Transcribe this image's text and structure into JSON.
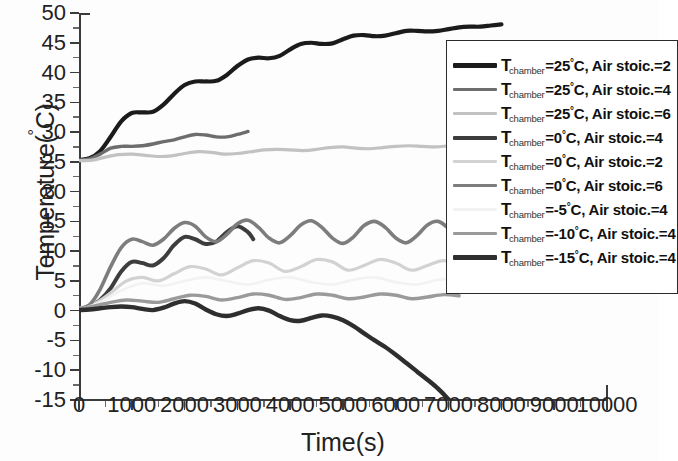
{
  "chart_data": {
    "type": "line",
    "title": "",
    "xlabel": "Time(s)",
    "ylabel": "Temperature(°C)",
    "xlim": [
      0,
      10000
    ],
    "ylim": [
      -15,
      50
    ],
    "xticks": [
      0,
      1000,
      2000,
      3000,
      4000,
      5000,
      6000,
      7000,
      8000,
      9000,
      10000
    ],
    "yticks": [
      -15,
      -10,
      -5,
      0,
      5,
      10,
      15,
      20,
      25,
      30,
      35,
      40,
      45,
      50
    ],
    "grid": false,
    "legend_position": "right-inside",
    "series": [
      {
        "name": "T_chamber=25°C, Air stoic.=2",
        "chamber_temp": 25,
        "air_stoic": 2,
        "color": "#1b1b1b",
        "width": 4.2,
        "x": [
          0,
          200,
          400,
          600,
          800,
          1000,
          1200,
          1400,
          1600,
          1800,
          2000,
          2200,
          2400,
          2600,
          2800,
          3000,
          3200,
          3400,
          3600,
          3800,
          4000,
          4200,
          4400,
          4600,
          4800,
          5000,
          5200,
          5400,
          5600,
          5800,
          6000,
          6200,
          6400,
          6600,
          6800,
          7000,
          7200,
          7400,
          7600,
          7800,
          8000
        ],
        "y": [
          25.3,
          25.6,
          26.8,
          29.2,
          31.8,
          33.2,
          33.3,
          33.4,
          34.6,
          36.4,
          37.9,
          38.5,
          38.5,
          38.6,
          39.6,
          41.1,
          42.2,
          42.5,
          42.4,
          42.8,
          43.9,
          44.8,
          45.0,
          44.8,
          44.9,
          45.6,
          46.2,
          46.3,
          46.1,
          46.2,
          46.6,
          47.0,
          47.0,
          46.9,
          47.0,
          47.3,
          47.6,
          47.7,
          47.7,
          47.9,
          48.1
        ]
      },
      {
        "name": "T_chamber=25°C, Air stoic.=4",
        "chamber_temp": 25,
        "air_stoic": 4,
        "color": "#6d6d6d",
        "width": 3.4,
        "x": [
          0,
          200,
          400,
          600,
          800,
          1000,
          1200,
          1400,
          1600,
          1800,
          2000,
          2200,
          2400,
          2600,
          2800,
          3000,
          3200
        ],
        "y": [
          25.3,
          25.5,
          26.3,
          27.3,
          27.6,
          27.6,
          27.7,
          28.0,
          28.4,
          28.7,
          29.2,
          29.6,
          29.5,
          29.2,
          29.2,
          29.6,
          30.1
        ]
      },
      {
        "name": "T_chamber=25°C, Air stoic.=6",
        "chamber_temp": 25,
        "air_stoic": 6,
        "color": "#c2c2c2",
        "width": 3.2,
        "x": [
          0,
          250,
          500,
          750,
          1000,
          1250,
          1500,
          1750,
          2000,
          2250,
          2500,
          2750,
          3000,
          3250,
          3500,
          3750,
          4000,
          4250,
          4500,
          4750,
          5000,
          5250,
          5500,
          5750,
          6000,
          6250,
          6500,
          6750,
          7000,
          7250,
          7500,
          7750,
          8000
        ],
        "y": [
          25.2,
          25.3,
          25.8,
          26.2,
          26.3,
          26.1,
          25.9,
          26.0,
          26.4,
          26.7,
          26.6,
          26.3,
          26.4,
          26.7,
          27.0,
          27.1,
          27.0,
          26.9,
          27.1,
          27.4,
          27.5,
          27.3,
          27.2,
          27.4,
          27.6,
          27.7,
          27.6,
          27.5,
          27.7,
          27.9,
          27.9,
          27.7,
          27.6
        ]
      },
      {
        "name": "T_chamber=0°C, Air stoic.=4",
        "chamber_temp": 0,
        "air_stoic": 4,
        "color": "#3d3d3d",
        "width": 4.0,
        "x": [
          0,
          200,
          400,
          600,
          800,
          1000,
          1200,
          1400,
          1600,
          1800,
          2000,
          2200,
          2400,
          2600,
          2800,
          3000,
          3200,
          3300
        ],
        "y": [
          0.3,
          0.6,
          1.8,
          3.8,
          6.6,
          8.2,
          8.0,
          7.6,
          8.8,
          11.0,
          12.4,
          12.0,
          11.2,
          11.6,
          13.2,
          14.2,
          13.2,
          12.0
        ]
      },
      {
        "name": "T_chamber=0°C, Air stoic.=2",
        "chamber_temp": 0,
        "air_stoic": 2,
        "color": "#d2d2d2",
        "width": 3.2,
        "x": [
          0,
          300,
          600,
          900,
          1200,
          1500,
          1800,
          2100,
          2400,
          2700,
          3000,
          3300,
          3600,
          3900,
          4200,
          4500,
          4800,
          5100,
          5400,
          5700,
          6000,
          6300,
          6600,
          6900,
          7200
        ],
        "y": [
          0.4,
          1.2,
          3.0,
          5.0,
          5.6,
          5.0,
          6.2,
          7.4,
          7.0,
          6.0,
          7.2,
          8.4,
          8.0,
          6.6,
          7.4,
          8.6,
          8.2,
          6.8,
          7.6,
          8.6,
          8.0,
          6.8,
          7.6,
          8.4,
          7.6
        ]
      },
      {
        "name": "T_chamber=0°C, Air stoic.=6",
        "chamber_temp": 0,
        "air_stoic": 6,
        "color": "#7d7d7d",
        "width": 3.6,
        "x": [
          0,
          200,
          400,
          600,
          800,
          1000,
          1200,
          1400,
          1600,
          1800,
          2000,
          2200,
          2400,
          2600,
          2800,
          3000,
          3200,
          3400,
          3600,
          3800,
          4000,
          4200,
          4400,
          4600,
          4800,
          5000,
          5200,
          5400,
          5600,
          5800,
          6000,
          6200,
          6400,
          6600,
          6800,
          7000,
          7100
        ],
        "y": [
          0.3,
          1.0,
          3.6,
          7.4,
          10.6,
          12.0,
          11.6,
          11.0,
          12.0,
          13.8,
          14.8,
          14.2,
          12.4,
          11.6,
          12.8,
          14.6,
          15.2,
          14.0,
          12.2,
          11.4,
          12.6,
          14.4,
          15.1,
          14.0,
          12.2,
          11.3,
          12.4,
          14.3,
          15.0,
          14.0,
          12.2,
          11.4,
          12.6,
          14.4,
          15.0,
          13.8,
          12.6
        ]
      },
      {
        "name": "T_chamber=-5°C, Air stoic.=4",
        "chamber_temp": -5,
        "air_stoic": 4,
        "color": "#f2f2f2",
        "width": 2.6,
        "x": [
          0,
          400,
          800,
          1200,
          1600,
          2000,
          2400,
          2800,
          3200,
          3600,
          4000,
          4400,
          4800,
          5200,
          5600,
          6000,
          6400,
          6800,
          7200
        ],
        "y": [
          0.2,
          1.4,
          3.4,
          4.6,
          4.2,
          5.0,
          5.6,
          5.0,
          4.4,
          5.2,
          5.6,
          4.8,
          4.4,
          5.2,
          5.6,
          4.8,
          4.4,
          5.2,
          5.4
        ]
      },
      {
        "name": "T_chamber=-10°C, Air stoic.=4",
        "chamber_temp": -10,
        "air_stoic": 4,
        "color": "#9a9a9a",
        "width": 3.4,
        "x": [
          0,
          300,
          600,
          900,
          1200,
          1500,
          1800,
          2100,
          2400,
          2700,
          3000,
          3300,
          3600,
          3900,
          4200,
          4500,
          4800,
          5100,
          5400,
          5700,
          6000,
          6300,
          6600,
          6900,
          7200
        ],
        "y": [
          0.2,
          0.8,
          1.4,
          1.8,
          1.6,
          1.4,
          2.0,
          2.6,
          2.4,
          1.8,
          2.2,
          2.8,
          2.6,
          1.9,
          2.2,
          2.8,
          2.6,
          2.0,
          2.3,
          2.8,
          2.6,
          2.0,
          2.3,
          2.7,
          2.5
        ]
      },
      {
        "name": "T_chamber=-15°C, Air stoic.=4",
        "chamber_temp": -15,
        "air_stoic": 4,
        "color": "#2e2e2e",
        "width": 4.4,
        "x": [
          0,
          200,
          400,
          600,
          800,
          1000,
          1200,
          1400,
          1600,
          1800,
          2000,
          2200,
          2400,
          2600,
          2800,
          3000,
          3200,
          3400,
          3600,
          3800,
          4000,
          4200,
          4400,
          4600,
          4800,
          5000,
          5200,
          5400,
          5600,
          5800,
          6000,
          6200,
          6400,
          6600,
          6800,
          7000
        ],
        "y": [
          0.1,
          0.2,
          0.4,
          0.6,
          0.7,
          0.6,
          0.3,
          0.1,
          0.5,
          1.2,
          1.6,
          1.2,
          0.2,
          -0.6,
          -0.9,
          -0.5,
          0.1,
          0.4,
          0.0,
          -0.9,
          -1.6,
          -1.7,
          -1.2,
          -0.8,
          -1.0,
          -1.6,
          -2.6,
          -3.8,
          -5.0,
          -6.1,
          -7.4,
          -8.8,
          -10.2,
          -11.6,
          -13.1,
          -14.9
        ]
      }
    ]
  },
  "legend": {
    "rows": [
      {
        "t": "T",
        "sub": "chamber",
        "cond": "=25°C, Air stoic.=2"
      },
      {
        "t": "T",
        "sub": "chamber",
        "cond": "=25°C, Air stoic.=4"
      },
      {
        "t": "T",
        "sub": "chamber",
        "cond": "=25°C, Air stoic.=6"
      },
      {
        "t": "T",
        "sub": "chamber",
        "cond": "=0°C, Air stoic.=4"
      },
      {
        "t": "T",
        "sub": "chamber",
        "cond": "=0°C, Air stoic.=2"
      },
      {
        "t": "T",
        "sub": "chamber",
        "cond": "=0°C, Air stoic.=6"
      },
      {
        "t": "T",
        "sub": "chamber",
        "cond": "=-5°C, Air stoic.=4"
      },
      {
        "t": "T",
        "sub": "chamber",
        "cond": "=-10°C, Air stoic.=4"
      },
      {
        "t": "T",
        "sub": "chamber",
        "cond": "=-15°C, Air stoic.=4"
      }
    ]
  },
  "axes": {
    "ylabel_text": "Temperature(",
    "ylabel_deg": "°",
    "ylabel_tail": "C)",
    "xlabel_text": "Time(s)"
  }
}
